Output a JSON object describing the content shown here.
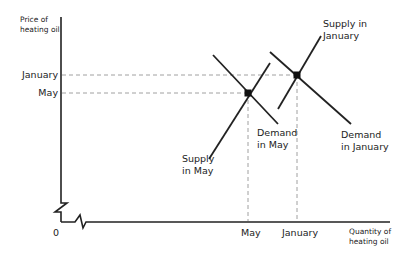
{
  "diagram": {
    "type": "supply-demand",
    "y_axis_label": [
      "Price of",
      "heating oil"
    ],
    "x_axis_label": [
      "Quantity of",
      "heating oil"
    ],
    "origin_label": "0",
    "y_ticks": [
      {
        "label": "January"
      },
      {
        "label": "May"
      }
    ],
    "x_ticks": [
      {
        "label": "May"
      },
      {
        "label": "January"
      }
    ],
    "curves": [
      {
        "name": "Supply in May",
        "lines": [
          "Supply",
          "in May"
        ]
      },
      {
        "name": "Demand in May",
        "lines": [
          "Demand",
          "in May"
        ]
      },
      {
        "name": "Supply in January",
        "lines": [
          "Supply in",
          "January"
        ]
      },
      {
        "name": "Demand in January",
        "lines": [
          "Demand",
          "in January"
        ]
      }
    ],
    "equilibria": [
      {
        "name": "May equilibrium"
      },
      {
        "name": "January equilibrium"
      }
    ],
    "colors": {
      "line": "#222222",
      "dash": "#888888"
    }
  }
}
